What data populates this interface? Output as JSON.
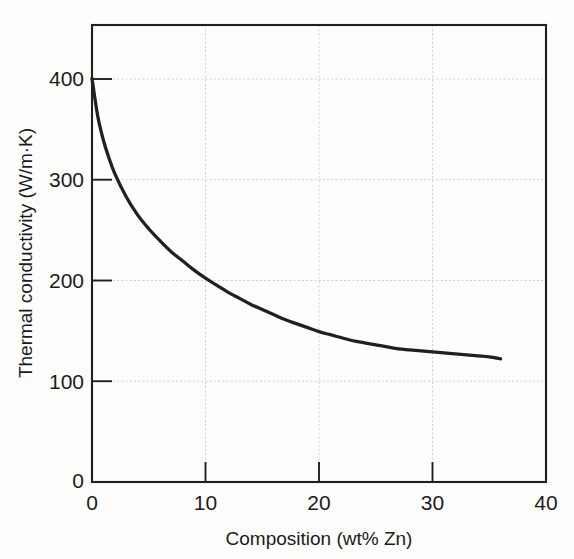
{
  "chart_data": {
    "type": "line",
    "title": "",
    "xlabel": "Composition (wt% Zn)",
    "ylabel": "Thermal conductivity (W/m·K)",
    "xlim": [
      0,
      40
    ],
    "ylim": [
      0,
      453
    ],
    "xticks": [
      0,
      10,
      20,
      30,
      40
    ],
    "xtick_labels": [
      "0",
      "10",
      "20",
      "30",
      "40"
    ],
    "yticks": [
      0,
      100,
      200,
      300,
      400
    ],
    "ytick_labels": [
      "0",
      "100",
      "200",
      "300",
      "400"
    ],
    "grid": true,
    "legend": "none",
    "series": [
      {
        "name": "Copper-zinc alloy thermal conductivity",
        "color": "#231f20",
        "x": [
          0,
          0.5,
          1,
          1.5,
          2,
          3,
          4,
          5,
          6,
          7,
          8,
          9,
          10,
          11,
          12,
          13,
          14,
          15,
          16,
          17,
          18,
          19,
          20,
          21,
          22,
          23,
          24,
          25,
          26,
          27,
          28,
          29,
          30,
          31,
          32,
          33,
          34,
          35,
          36
        ],
        "y": [
          400,
          363,
          339,
          321,
          306,
          283,
          265,
          251,
          239,
          228,
          219,
          210,
          202,
          195,
          188,
          182,
          176,
          171,
          166,
          161,
          157,
          153,
          149,
          146,
          143,
          140,
          138,
          136,
          134,
          132,
          131,
          130,
          129,
          128,
          127,
          126,
          125,
          124,
          122
        ]
      }
    ],
    "endpoints": {
      "start": {
        "x": 0,
        "y": 400
      },
      "end": {
        "x": 36,
        "y": 122
      }
    }
  },
  "axes": {
    "x": {
      "label": "Composition (wt% Zn)",
      "ticks": [
        "0",
        "10",
        "20",
        "30",
        "40"
      ]
    },
    "y": {
      "label": "Thermal conductivity (W/m·K)",
      "ticks": [
        "0",
        "100",
        "200",
        "300",
        "400"
      ]
    }
  },
  "colors": {
    "curve": "#231f20",
    "frame": "#231f20",
    "grid": "#cfcfcf",
    "background": "#fdfdfb",
    "text": "#1b1b1b"
  }
}
